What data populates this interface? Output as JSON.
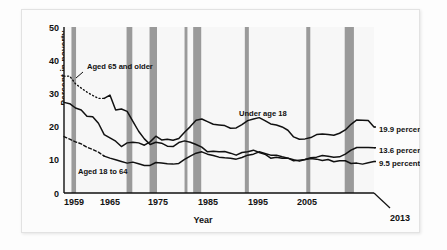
{
  "chart_data": {
    "type": "line",
    "title": "",
    "xlabel": "Year",
    "ylabel": "Percent in poverty",
    "xlim": [
      1959,
      2013
    ],
    "ylim": [
      0,
      50
    ],
    "grid": false,
    "legend_position": "inline-annotations",
    "x_ticks": [
      "1959",
      "1965",
      "1975",
      "1985",
      "1995",
      "2005"
    ],
    "x_tick_values": [
      1959,
      1965,
      1975,
      1985,
      1995,
      2005
    ],
    "x_end_tick": "2013",
    "y_ticks": [
      "0",
      "10",
      "20",
      "30",
      "40",
      "50"
    ],
    "y_tick_values": [
      0,
      10,
      20,
      30,
      40,
      50
    ],
    "x": [
      1959,
      1960,
      1961,
      1962,
      1963,
      1964,
      1965,
      1966,
      1967,
      1968,
      1969,
      1970,
      1971,
      1972,
      1973,
      1974,
      1975,
      1976,
      1977,
      1978,
      1979,
      1980,
      1981,
      1982,
      1983,
      1984,
      1985,
      1986,
      1987,
      1988,
      1989,
      1990,
      1991,
      1992,
      1993,
      1994,
      1995,
      1996,
      1997,
      1998,
      1999,
      2000,
      2001,
      2002,
      2003,
      2004,
      2005,
      2006,
      2007,
      2008,
      2009,
      2010,
      2011,
      2012,
      2013
    ],
    "series": [
      {
        "name": "Under age 18",
        "annotation": "Under age 18",
        "end_label": "19.9 percent",
        "end_value": 19.9,
        "style": "solid",
        "values": [
          27.3,
          26.9,
          25.6,
          25.0,
          23.1,
          23.0,
          21.0,
          17.6,
          16.6,
          15.6,
          14.0,
          15.1,
          15.3,
          15.1,
          14.4,
          15.4,
          17.1,
          16.0,
          16.2,
          15.9,
          16.4,
          18.3,
          20.0,
          21.9,
          22.3,
          21.5,
          20.7,
          20.5,
          20.3,
          19.5,
          19.6,
          20.6,
          21.8,
          22.3,
          22.7,
          21.8,
          20.8,
          20.5,
          19.9,
          18.9,
          16.9,
          16.2,
          16.3,
          16.7,
          17.6,
          17.8,
          17.6,
          17.4,
          18.0,
          19.0,
          20.7,
          22.0,
          21.9,
          21.8,
          19.9
        ]
      },
      {
        "name": "Aged 18 to 64",
        "annotation": "Aged 18 to 64",
        "end_label": "13.6 percent",
        "end_value": 13.6,
        "style": "solid-with-dashed-lead",
        "values": [
          17.0,
          16.2,
          15.4,
          14.8,
          13.8,
          13.1,
          12.3,
          11.1,
          10.5,
          10.0,
          9.5,
          9.0,
          9.3,
          8.8,
          8.3,
          8.3,
          9.2,
          9.0,
          8.8,
          8.7,
          8.9,
          10.1,
          11.1,
          12.0,
          12.4,
          11.7,
          11.3,
          10.8,
          10.6,
          10.5,
          10.2,
          10.7,
          11.4,
          11.7,
          12.4,
          11.9,
          11.4,
          11.4,
          10.9,
          10.5,
          10.0,
          9.6,
          10.1,
          10.6,
          10.8,
          11.3,
          11.1,
          10.8,
          10.9,
          11.7,
          12.9,
          13.7,
          13.7,
          13.7,
          13.6
        ]
      },
      {
        "name": "Aged 65 and older",
        "annotation": "Aged 65 and older",
        "end_label": "9.5 percent",
        "end_value": 9.5,
        "style": "dotted-then-solid",
        "values": [
          35.2,
          35.2,
          32.9,
          31.6,
          30.4,
          29.4,
          28.5,
          28.5,
          29.5,
          25.0,
          25.3,
          24.6,
          21.6,
          18.6,
          16.3,
          14.6,
          15.3,
          15.0,
          14.1,
          14.0,
          15.2,
          15.7,
          15.3,
          14.6,
          13.8,
          12.4,
          12.6,
          12.4,
          12.5,
          12.0,
          11.4,
          12.2,
          12.4,
          12.9,
          12.2,
          11.7,
          10.5,
          10.8,
          10.5,
          10.5,
          9.7,
          9.9,
          10.1,
          10.4,
          10.2,
          9.8,
          10.1,
          9.4,
          9.7,
          9.7,
          8.9,
          9.0,
          8.7,
          9.1,
          9.5
        ]
      }
    ],
    "recession_bands": [
      {
        "start": 1960.3,
        "end": 1961.1
      },
      {
        "start": 1969.9,
        "end": 1970.9
      },
      {
        "start": 1973.9,
        "end": 1975.2
      },
      {
        "start": 1980.0,
        "end": 1980.5
      },
      {
        "start": 1981.5,
        "end": 1982.9
      },
      {
        "start": 1990.5,
        "end": 1991.2
      },
      {
        "start": 2001.2,
        "end": 2001.9
      },
      {
        "start": 2007.9,
        "end": 2009.5
      }
    ],
    "recession_color": "#9a9a9a",
    "line_color": "#111111",
    "plot_background": "#f7f7f7"
  },
  "annotations": {
    "aged_65": "Aged 65 and older",
    "aged_18_64": "Aged 18 to 64",
    "under_18": "Under age 18"
  },
  "end_labels": {
    "under_18": "19.9 percent",
    "aged_18_64": "13.6 percent",
    "aged_65": "9.5 percent"
  },
  "axis": {
    "y_label": "Percent in poverty",
    "x_label": "Year",
    "y_tick_0": "0",
    "y_tick_10": "10",
    "y_tick_20": "20",
    "y_tick_30": "30",
    "y_tick_40": "40",
    "y_tick_50": "50",
    "x_tick_1959": "1959",
    "x_tick_1965": "1965",
    "x_tick_1975": "1975",
    "x_tick_1985": "1985",
    "x_tick_1995": "1995",
    "x_tick_2005": "2005",
    "x_tick_2013": "2013"
  }
}
